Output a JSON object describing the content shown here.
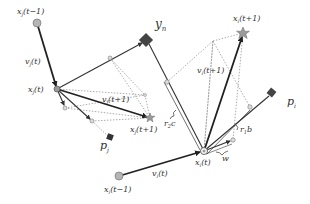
{
  "diagram": {
    "type": "particle-swarm-velocity-update",
    "labels": {
      "xj_prev": "x",
      "xj_prev_sub": "j",
      "xj_prev_arg": "(t−1)",
      "vj_t": "v",
      "vj_t_sub": "j",
      "vj_t_arg": "(t)",
      "xj_t": "x",
      "xj_t_sub": "j",
      "xj_t_arg": "(t)",
      "vj_next": "v",
      "vj_next_sub": "j",
      "vj_next_arg": "(t+1)",
      "xj_next": "x",
      "xj_next_sub": "j",
      "xj_next_arg": "(t+1)",
      "pj": "p",
      "pj_sub": "j",
      "yn": "y",
      "yn_sub": "n",
      "xi_prev": "x",
      "xi_prev_sub": "i",
      "xi_prev_arg": "(t−1)",
      "vi_t": "v",
      "vi_t_sub": "i",
      "vi_t_arg": "(t)",
      "xi_t": "x",
      "xi_t_sub": "i",
      "xi_t_arg": "(t)",
      "vi_next": "v",
      "vi_next_sub": "i",
      "vi_next_arg": "(t+1)",
      "xi_next": "x",
      "xi_next_sub": "i",
      "xi_next_arg": "(t+1)",
      "pi": "p",
      "pi_sub": "i",
      "r2c": "r",
      "r2c_sub": "2",
      "r2c_tail": "c",
      "r1b": "r",
      "r1b_sub": "1",
      "r1b_tail": "b",
      "w": "w"
    },
    "colors": {
      "line": "#333333",
      "dotted": "#888888",
      "node_fill": "#b5b5b5",
      "node_stroke": "#777777",
      "diamond": "#444444",
      "star": "#9a9a9a"
    }
  }
}
